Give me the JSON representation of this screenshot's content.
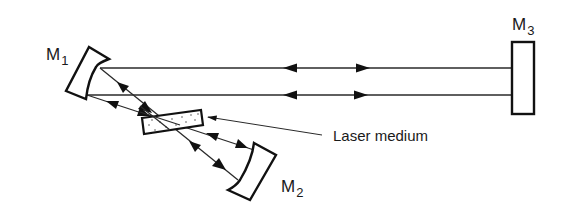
{
  "diagram": {
    "title": "",
    "type": "folded three-mirror laser cavity",
    "components": {
      "m1": {
        "label": "M",
        "subscript": "1",
        "kind": "concave-mirror"
      },
      "m2": {
        "label": "M",
        "subscript": "2",
        "kind": "concave-mirror"
      },
      "m3": {
        "label": "M",
        "subscript": "3",
        "kind": "flat-mirror"
      },
      "medium": {
        "label": "Laser medium",
        "kind": "gain-medium"
      }
    },
    "beams": [
      {
        "from": "M1",
        "to": "M3",
        "direction": "bidirectional"
      },
      {
        "from": "M1",
        "to": "M3",
        "direction": "bidirectional"
      },
      {
        "from": "M1",
        "to": "M2",
        "via": "Laser medium",
        "direction": "bidirectional"
      },
      {
        "from": "M1",
        "to": "M2",
        "via": "Laser medium",
        "direction": "bidirectional"
      }
    ],
    "colors": {
      "ink": "#1a1a1a",
      "background": "#ffffff"
    }
  }
}
